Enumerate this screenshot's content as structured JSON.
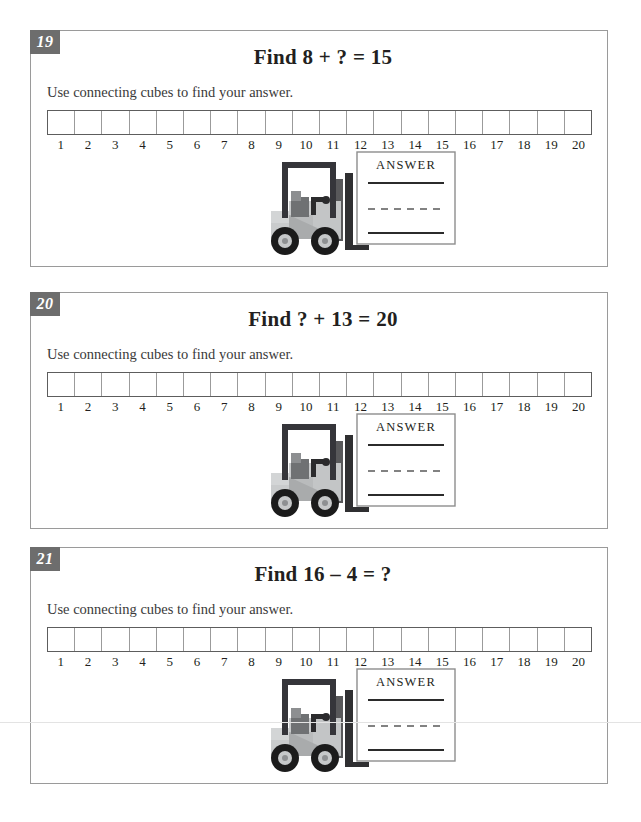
{
  "page": {
    "background_color": "#ffffff",
    "badge_color": "#6d6d6d",
    "panel_border_color": "#9a9a9a",
    "forklift_body_color": "#c9cbcc",
    "forklift_dark_color": "#3a3a3c",
    "tire_color": "#1b1b1b"
  },
  "problems": [
    {
      "number": "19",
      "title": "Find 8 + ? = 15",
      "instruction": "Use connecting cubes to find your answer.",
      "answer_label": "ANSWER",
      "number_strip": {
        "count": 20,
        "labels": [
          "1",
          "2",
          "3",
          "4",
          "5",
          "6",
          "7",
          "8",
          "9",
          "10",
          "11",
          "12",
          "13",
          "14",
          "15",
          "16",
          "17",
          "18",
          "19",
          "20"
        ]
      }
    },
    {
      "number": "20",
      "title": "Find ? + 13 = 20",
      "instruction": "Use connecting cubes to find your answer.",
      "answer_label": "ANSWER",
      "number_strip": {
        "count": 20,
        "labels": [
          "1",
          "2",
          "3",
          "4",
          "5",
          "6",
          "7",
          "8",
          "9",
          "10",
          "11",
          "12",
          "13",
          "14",
          "15",
          "16",
          "17",
          "18",
          "19",
          "20"
        ]
      }
    },
    {
      "number": "21",
      "title": "Find 16 – 4 = ?",
      "instruction": "Use connecting cubes to find your answer.",
      "answer_label": "ANSWER",
      "number_strip": {
        "count": 20,
        "labels": [
          "1",
          "2",
          "3",
          "4",
          "5",
          "6",
          "7",
          "8",
          "9",
          "10",
          "11",
          "12",
          "13",
          "14",
          "15",
          "16",
          "17",
          "18",
          "19",
          "20"
        ]
      }
    }
  ]
}
